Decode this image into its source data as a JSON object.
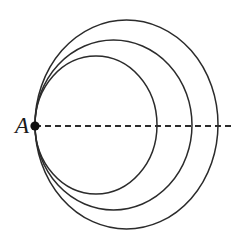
{
  "figure": {
    "background_color": "#ffffff",
    "stroke_color": "#2b2b2b",
    "label_color": "#1a1a1a",
    "width": 243,
    "height": 243,
    "tangent_point": {
      "name": "A",
      "label": "A",
      "x": 35,
      "y": 126,
      "dot_radius": 4.6
    },
    "label_position": {
      "x": 22,
      "y": 133,
      "font_size": 23
    },
    "curves": [
      {
        "name": "inner-circle",
        "shape": "ellipse",
        "cx": 96,
        "cy": 125,
        "rx": 61,
        "ry": 69,
        "stroke_width": 1.5
      },
      {
        "name": "middle-circle",
        "shape": "ellipse",
        "cx": 113.5,
        "cy": 125,
        "rx": 78.5,
        "ry": 85,
        "stroke_width": 1.5
      },
      {
        "name": "outer-circle",
        "shape": "ellipse",
        "cx": 126.5,
        "cy": 124.5,
        "rx": 91.5,
        "ry": 104.5,
        "stroke_width": 1.5
      }
    ],
    "dashed_line": {
      "name": "diameter-line",
      "x1": 35,
      "y1": 126,
      "x2": 234,
      "y2": 126,
      "dash": "6 4",
      "stroke_width": 1.8
    }
  }
}
